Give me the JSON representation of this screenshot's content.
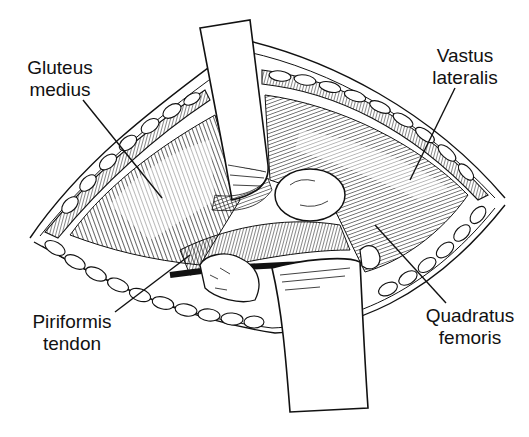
{
  "figure": {
    "colors": {
      "ink": "#111111",
      "background": "#ffffff"
    }
  },
  "labels": [
    {
      "id": "gluteus-medius",
      "lines": [
        "Gluteus",
        "medius"
      ]
    },
    {
      "id": "vastus-lateralis",
      "lines": [
        "Vastus",
        "lateralis"
      ]
    },
    {
      "id": "piriformis-tendon",
      "lines": [
        "Piriformis",
        "tendon"
      ]
    },
    {
      "id": "quadratus-femoris",
      "lines": [
        "Quadratus",
        "femoris"
      ]
    }
  ]
}
